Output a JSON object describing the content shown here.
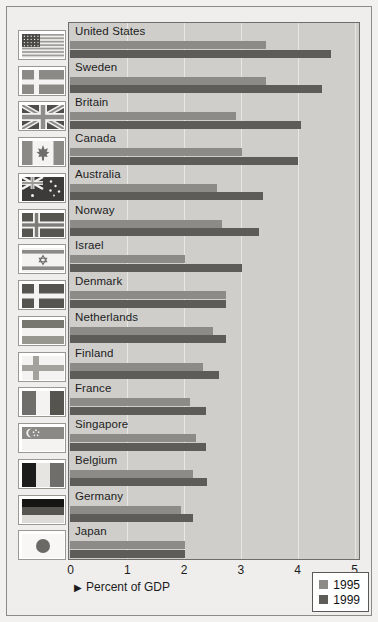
{
  "chart_data": {
    "type": "bar",
    "orientation": "horizontal",
    "title": "",
    "xlabel": "Percent of GDP",
    "ylabel": "",
    "xlim": [
      0,
      5
    ],
    "xticks": [
      0,
      1,
      2,
      3,
      4,
      5
    ],
    "xtick_labels": [
      "0",
      "1",
      "2",
      "3",
      "4",
      "5"
    ],
    "grid": true,
    "grid_axis": "x",
    "legend_position": "bottom-right",
    "categories": [
      "United States",
      "Sweden",
      "Britain",
      "Canada",
      "Australia",
      "Norway",
      "Israel",
      "Denmark",
      "Netherlands",
      "Finland",
      "France",
      "Singapore",
      "Belgium",
      "Germany",
      "Japan"
    ],
    "series": [
      {
        "name": "1995",
        "color": "#8c8b87",
        "values": [
          3.45,
          3.45,
          2.93,
          3.03,
          2.58,
          2.68,
          2.02,
          2.75,
          2.51,
          2.35,
          2.12,
          2.22,
          2.16,
          1.96,
          2.02
        ]
      },
      {
        "name": "1999",
        "color": "#5d5c59",
        "values": [
          4.59,
          4.44,
          4.07,
          4.02,
          3.4,
          3.32,
          3.03,
          2.74,
          2.75,
          2.63,
          2.4,
          2.4,
          2.42,
          2.16,
          2.02
        ]
      }
    ]
  },
  "legend": {
    "entries": [
      {
        "label": "1995",
        "color": "#8c8b87"
      },
      {
        "label": "1999",
        "color": "#5d5c59"
      }
    ]
  },
  "axis": {
    "title": "Percent of GDP",
    "arrow_glyph": "▶"
  },
  "flags": [
    {
      "country": "United States",
      "icon": "flag-united-states"
    },
    {
      "country": "Sweden",
      "icon": "flag-sweden"
    },
    {
      "country": "Britain",
      "icon": "flag-britain"
    },
    {
      "country": "Canada",
      "icon": "flag-canada"
    },
    {
      "country": "Australia",
      "icon": "flag-australia"
    },
    {
      "country": "Norway",
      "icon": "flag-norway"
    },
    {
      "country": "Israel",
      "icon": "flag-israel"
    },
    {
      "country": "Denmark",
      "icon": "flag-denmark"
    },
    {
      "country": "Netherlands",
      "icon": "flag-netherlands"
    },
    {
      "country": "Finland",
      "icon": "flag-finland"
    },
    {
      "country": "France",
      "icon": "flag-france"
    },
    {
      "country": "Singapore",
      "icon": "flag-singapore"
    },
    {
      "country": "Belgium",
      "icon": "flag-belgium"
    },
    {
      "country": "Germany",
      "icon": "flag-germany"
    },
    {
      "country": "Japan",
      "icon": "flag-japan"
    }
  ]
}
